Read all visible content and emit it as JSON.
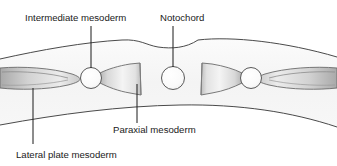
{
  "figure": {
    "background_color": "#ffffff",
    "width": 337,
    "height": 166,
    "line_color": "#4a4a4a",
    "text_color": "#1a1a1a",
    "tissue_fill_light": "#f2f2f2",
    "tissue_fill_mid": "#cfcfcf",
    "tissue_fill_dark": "#a8a8a8"
  },
  "labels": [
    {
      "id": "intermediate-mesoderm",
      "text": "Intermediate mesoderm",
      "x": 25,
      "y": 21,
      "anchor": "start",
      "leader": {
        "x1": 91,
        "y1": 26,
        "x2": 91,
        "y2": 68
      }
    },
    {
      "id": "notochord",
      "text": "Notochord",
      "x": 160,
      "y": 21,
      "anchor": "start",
      "leader": {
        "x1": 173,
        "y1": 26,
        "x2": 173,
        "y2": 67
      }
    },
    {
      "id": "paraxial-mesoderm",
      "text": "Paraxial mesoderm",
      "x": 113,
      "y": 133,
      "anchor": "start",
      "leader": {
        "x1": 137,
        "y1": 84,
        "x2": 137,
        "y2": 123
      }
    },
    {
      "id": "lateral-plate-mesoderm",
      "text": "Lateral plate mesoderm",
      "x": 16,
      "y": 158,
      "anchor": "start",
      "leader": {
        "x1": 33,
        "y1": 88,
        "x2": 33,
        "y2": 144
      }
    }
  ],
  "structures": {
    "embryo_band": {
      "name": "embryo-body-band",
      "top_edge": "M 0,59 C 40,50 85,42 122,40 C 140,39 146,45 158,47 C 172,49 186,48 198,40 C 232,36 286,42 337,57",
      "bottom_edge": "M 0,125 C 60,114 120,106 180,105 C 240,104 292,112 337,127"
    },
    "notochord_circle": {
      "cx": 173,
      "cy": 78,
      "r": 11.5
    },
    "intermediate_circles": [
      {
        "id": "intermediate-left",
        "cx": 91,
        "cy": 78,
        "r": 10.5
      },
      {
        "id": "intermediate-right",
        "cx": 251,
        "cy": 78,
        "r": 10.5
      }
    ],
    "paraxial_blocks": [
      {
        "id": "paraxial-left",
        "side": "left"
      },
      {
        "id": "paraxial-right",
        "side": "right"
      }
    ],
    "lateral_plates": [
      {
        "id": "lateral-plate-left",
        "side": "left"
      },
      {
        "id": "lateral-plate-right",
        "side": "right"
      }
    ]
  }
}
